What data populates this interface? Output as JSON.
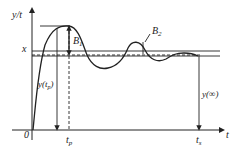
{
  "diagram": {
    "axis": {
      "y_label": "y/t",
      "x_label": "t",
      "origin_label": "0"
    },
    "levels": {
      "steady_label": "x"
    },
    "annotations": {
      "peak_overshoot": "B",
      "peak_overshoot_sub": "1",
      "second_overshoot": "B",
      "second_overshoot_sub": "2",
      "peak_value": "y(t",
      "peak_value_sub": "p",
      "peak_value_close": ")",
      "final_value": "y(∞)"
    },
    "ticks": {
      "peak_time": "t",
      "peak_time_sub": "p",
      "settling_time": "t",
      "settling_time_sub": "s"
    }
  }
}
